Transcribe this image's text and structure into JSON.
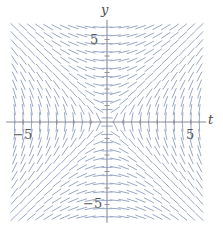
{
  "figure": {
    "width": 223,
    "height": 230,
    "background": "#ffffff"
  },
  "axes": {
    "x_axis_label": "t",
    "y_axis_label": "y",
    "axis_color": "#8a8a96",
    "origin_px": [
      107,
      122
    ],
    "unit_px_x": 16.8,
    "unit_px_y": 16.5,
    "x_range": [
      -6.0,
      5.9
    ],
    "y_range": [
      -6.1,
      6.2
    ],
    "ticks": {
      "x": [
        {
          "value": -5,
          "label": "−5"
        },
        {
          "value": 5,
          "label": "5"
        }
      ],
      "y": [
        {
          "value": 5,
          "label": "5"
        },
        {
          "value": -5,
          "label": "−5"
        }
      ]
    },
    "tick_values_unlabeled_x": [
      -5,
      -4,
      -3,
      -2,
      -1,
      1,
      2,
      3,
      4,
      5
    ],
    "tick_values_unlabeled_y": [
      -5,
      -4,
      -3,
      -2,
      -1,
      1,
      2,
      3,
      4,
      5
    ],
    "grid": false
  },
  "chart_data": {
    "type": "scatter",
    "plot_kind": "slope-field",
    "title": "",
    "subtitle": "",
    "xlabel": "t",
    "ylabel": "y",
    "xlim": [
      -6.0,
      5.9
    ],
    "ylim": [
      -6.1,
      6.2
    ],
    "grid": false,
    "legend": null,
    "annotations": [],
    "equation": "dy/dt = t/y",
    "slope_color": "#9aa8c8",
    "slope_line_width": 1.0,
    "segment_half_length_px": 5.2,
    "sample_grid": {
      "t_start": -5.5,
      "t_end": 5.5,
      "t_step": 0.5,
      "y_start": -5.75,
      "y_end": 5.75,
      "y_step": 0.5
    },
    "notes": [
      "Short line segments centered on each sample point.",
      "Slope at (t,y) equals t divided by y.",
      "Segments are nearly horizontal near the y-axis (t = 0).",
      "Segments are nearly vertical near the t-axis (y = 0).",
      "Upper-left and lower-right quadrants have negative slopes.",
      "Upper-right and lower-left quadrants have positive slopes."
    ],
    "series": [
      {
        "name": "slope segments",
        "values": []
      }
    ]
  }
}
